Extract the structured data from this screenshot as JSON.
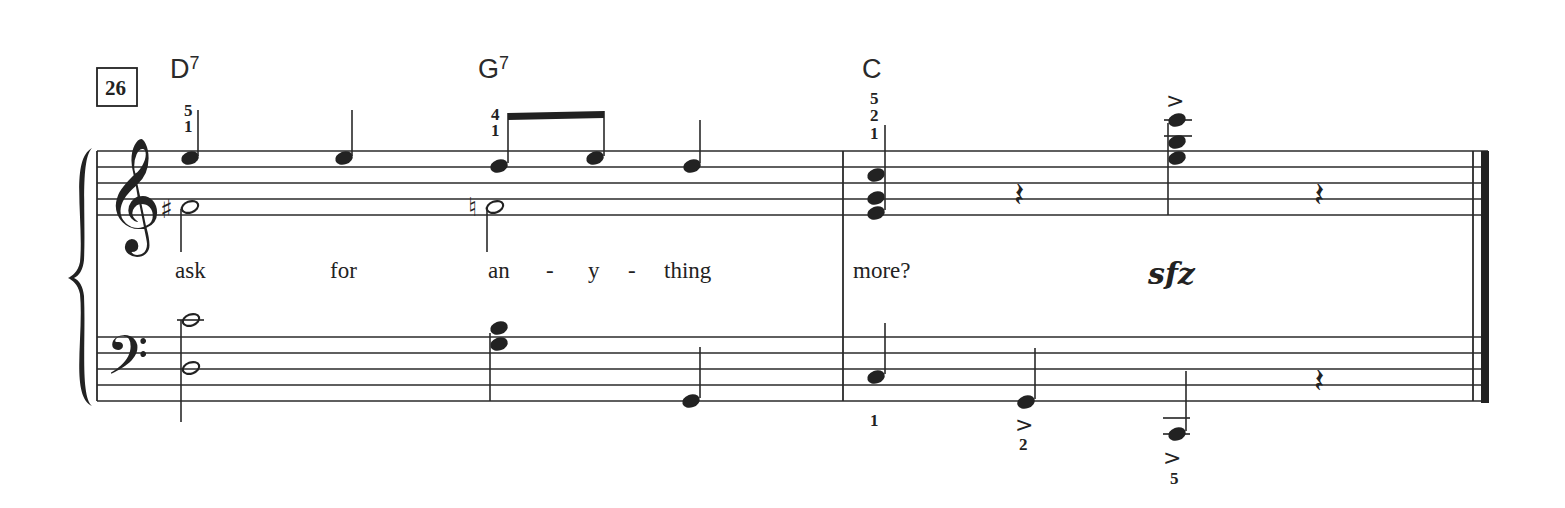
{
  "score": {
    "rehearsal_mark": "26",
    "chord_symbols": [
      {
        "root": "D",
        "ext": "7",
        "x": 170
      },
      {
        "root": "G",
        "ext": "7",
        "x": 478
      },
      {
        "root": "C",
        "ext": "",
        "x": 862
      }
    ],
    "lyrics": [
      {
        "text": "ask",
        "x": 175
      },
      {
        "text": "for",
        "x": 330
      },
      {
        "text": "an",
        "x": 488
      },
      {
        "text": "-",
        "x": 546
      },
      {
        "text": "y",
        "x": 588
      },
      {
        "text": "-",
        "x": 628
      },
      {
        "text": "thing",
        "x": 664
      },
      {
        "text": "more?",
        "x": 853
      }
    ],
    "dynamic": {
      "text": "sfz",
      "x": 1148
    },
    "treble_fingerings": [
      {
        "digits": [
          "5",
          "1"
        ],
        "x": 184
      },
      {
        "digits": [
          "4",
          "1"
        ],
        "x": 491
      },
      {
        "digits": [
          "5",
          "2",
          "1"
        ],
        "x": 870
      }
    ],
    "bass_fingerings": [
      {
        "digit": "1",
        "x": 870,
        "y": 426
      },
      {
        "digit": "2",
        "x": 1021,
        "y": 452
      },
      {
        "digit": "5",
        "x": 1170,
        "y": 485
      }
    ],
    "accent_symbol": ">",
    "sharp_symbol": "♯",
    "natural_symbol": "♮",
    "treble_clef": "𝄞",
    "bass_clef": "𝄢",
    "rest_symbol": "𝄽"
  }
}
